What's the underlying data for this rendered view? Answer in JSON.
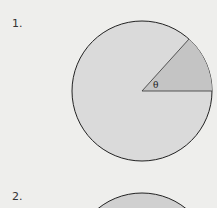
{
  "figures": [
    {
      "number": "1.",
      "angle_label": "θ",
      "fill": "#dadada",
      "sector_fill": "#c4c4c4"
    },
    {
      "number": "2.",
      "fill": "#d0d0d0"
    }
  ]
}
